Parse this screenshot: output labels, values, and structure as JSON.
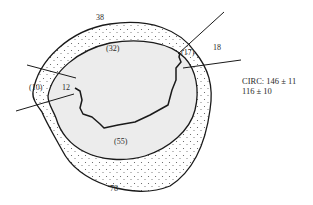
{
  "diagram": {
    "type": "cross-section wall thickness diagram",
    "colors": {
      "outline": "#1a1a1a",
      "inner_fill": "#ececec",
      "wall_fill": "#ffffff",
      "stipple": "#555555",
      "background": "#ffffff"
    },
    "labels": {
      "top_outer": "38",
      "top_inner": "(32)",
      "right_outer": "18",
      "right_inner": "(17)",
      "left_outer": "(10)",
      "left_inner": "12",
      "bottom_inner": "(55)",
      "bottom_outer": "78"
    },
    "circ": {
      "line1": "CIRC: 146 ± 11",
      "line2": "116 ± 10"
    }
  }
}
